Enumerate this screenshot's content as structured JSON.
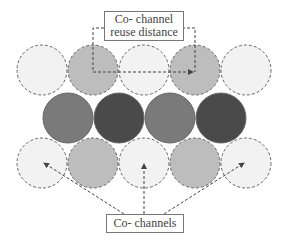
{
  "top_label": {
    "line1": "Co- channel",
    "line2": "reuse distance"
  },
  "bottom_label": "Co- channels",
  "colors": {
    "light": "#f2f2f2",
    "medium": "#bdbdbd",
    "dark": "#7a7a7a",
    "darkest": "#4a4a4a"
  },
  "rows": [
    {
      "y": 70,
      "cells": [
        {
          "x": 42,
          "shade": "light"
        },
        {
          "x": 93,
          "shade": "medium"
        },
        {
          "x": 144,
          "shade": "light"
        },
        {
          "x": 195,
          "shade": "medium"
        },
        {
          "x": 246,
          "shade": "light"
        }
      ]
    },
    {
      "y": 118,
      "cells": [
        {
          "x": 68,
          "shade": "dark"
        },
        {
          "x": 119,
          "shade": "darkest"
        },
        {
          "x": 170,
          "shade": "dark"
        },
        {
          "x": 221,
          "shade": "darkest"
        }
      ]
    },
    {
      "y": 163,
      "cells": [
        {
          "x": 42,
          "shade": "light"
        },
        {
          "x": 93,
          "shade": "medium"
        },
        {
          "x": 144,
          "shade": "light"
        },
        {
          "x": 195,
          "shade": "medium"
        },
        {
          "x": 246,
          "shade": "light"
        }
      ]
    }
  ]
}
